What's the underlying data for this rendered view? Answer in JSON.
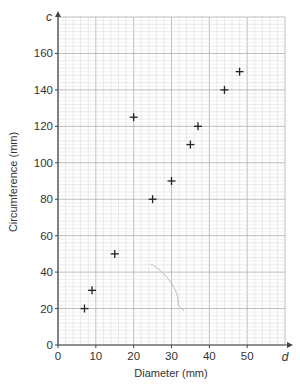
{
  "chart_data": {
    "type": "scatter",
    "title": "",
    "xlabel": "Diameter (mm)",
    "ylabel": "Circumference (mm)",
    "x_axis_variable": "d",
    "y_axis_variable": "c",
    "xlim": [
      0,
      60
    ],
    "ylim": [
      0,
      180
    ],
    "grid": true,
    "x_ticks": [
      0,
      10,
      20,
      30,
      40,
      50
    ],
    "y_ticks": [
      0,
      20,
      40,
      60,
      80,
      100,
      120,
      140,
      160
    ],
    "marker": "+",
    "points": [
      {
        "x": 7,
        "y": 20
      },
      {
        "x": 9,
        "y": 30
      },
      {
        "x": 15,
        "y": 50
      },
      {
        "x": 20,
        "y": 125
      },
      {
        "x": 25,
        "y": 80
      },
      {
        "x": 30,
        "y": 90
      },
      {
        "x": 35,
        "y": 110
      },
      {
        "x": 37,
        "y": 120
      },
      {
        "x": 44,
        "y": 140
      },
      {
        "x": 48,
        "y": 150
      }
    ],
    "annotations": [
      "faint pencil arc near d=32–35, c=20–45"
    ]
  }
}
